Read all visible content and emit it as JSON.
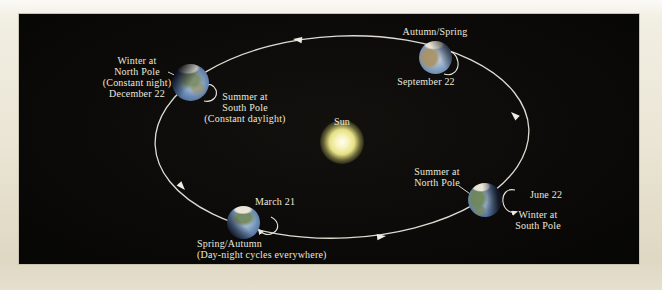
{
  "colors": {
    "page_background": "#eae5d4",
    "panel_background": "#0a0908",
    "orbit_line": "#dedcd2",
    "label_text": "#ece8da",
    "sun_core": "#fffef2",
    "sun_glow": "#e6e084",
    "earth_ocean": "#6d8cb4",
    "earth_land_green": "#76885c",
    "earth_land_tan": "#a89264"
  },
  "icons": {
    "orbit_direction_arrow": "triangle-arrowhead-on-orbit",
    "earth_spin_arrow": "curved-rotation-arrow"
  },
  "sun": {
    "label": "Sun"
  },
  "positions": {
    "december": {
      "north_label_lines": [
        "Winter at",
        "North Pole",
        "(Constant night)",
        "December 22"
      ],
      "south_label_lines": [
        "Summer at",
        "South Pole",
        "(Constant daylight)"
      ]
    },
    "september": {
      "season_label": "Autumn/Spring",
      "date_label": "September 22"
    },
    "march": {
      "date_label": "March 21",
      "season_lines": [
        "Spring/Autumn",
        "(Day-night cycles everywhere)"
      ]
    },
    "june": {
      "date_label": "June 22",
      "north_label_lines": [
        "Summer at",
        "North Pole"
      ],
      "south_label_lines": [
        "Winter at",
        "South Pole"
      ]
    }
  }
}
